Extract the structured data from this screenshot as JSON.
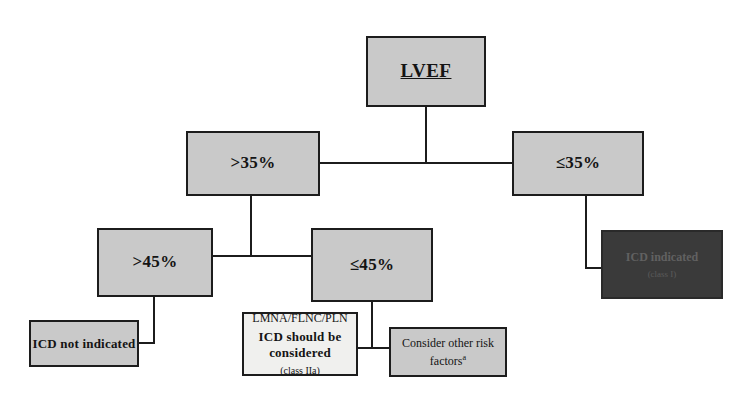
{
  "diagram": {
    "colors": {
      "box_fill": "#c9c9c9",
      "box_fill_light": "#f0f0ee",
      "box_fill_dark": "#3a3a3a",
      "border": "#1c1c1c",
      "connector": "#1c1c1c",
      "background": "#ffffff"
    },
    "nodes": {
      "root": {
        "label": "LVEF"
      },
      "lvef_gt35": {
        "label": ">35%"
      },
      "lvef_le35": {
        "label": "≤35%"
      },
      "lvef_gt45": {
        "label": ">45%"
      },
      "lvef_le45": {
        "label": "≤45%"
      },
      "icd_indicated": {
        "label": "ICD indicated",
        "class_recommendation": "(class I)"
      },
      "icd_not_indicated": {
        "label": "ICD not indicated"
      },
      "icd_considered": {
        "genes": "LMNA/FLNC/PLN",
        "label_line1": "ICD should be",
        "label_line2": "considered",
        "class_recommendation": "(class IIa)"
      },
      "other_risk": {
        "label_line1": "Consider other risk",
        "label_line2": "factors",
        "footnote_marker": "a"
      }
    }
  }
}
